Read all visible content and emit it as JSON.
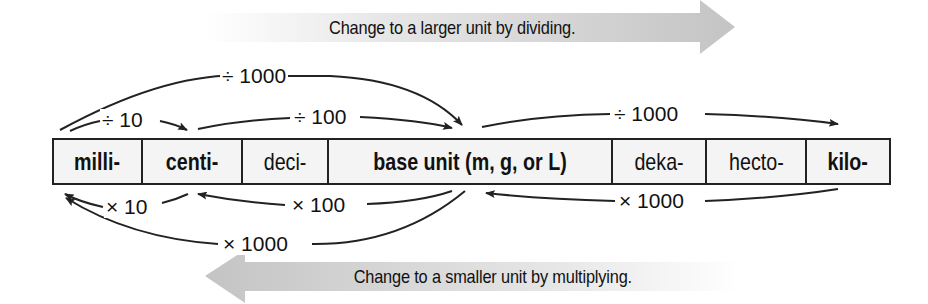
{
  "banners": {
    "top": "Change to a larger unit by dividing.",
    "bottom": "Change to a smaller unit by multiplying."
  },
  "units": [
    {
      "label": "milli-",
      "bold": true
    },
    {
      "label": "centi-",
      "bold": true
    },
    {
      "label": "deci-",
      "bold": false
    },
    {
      "label": "base unit (m, g, or L)",
      "bold": true
    },
    {
      "label": "deka-",
      "bold": false
    },
    {
      "label": "hecto-",
      "bold": false
    },
    {
      "label": "kilo-",
      "bold": true
    }
  ],
  "conversions": {
    "divide": [
      {
        "from": "milli-",
        "to": "centi-",
        "label": "÷ 10"
      },
      {
        "from": "centi-",
        "to": "base unit",
        "label": "÷ 100"
      },
      {
        "from": "milli-",
        "to": "base unit",
        "label": "÷ 1000"
      },
      {
        "from": "base unit",
        "to": "kilo-",
        "label": "÷ 1000"
      }
    ],
    "multiply": [
      {
        "from": "centi-",
        "to": "milli-",
        "label": "× 10"
      },
      {
        "from": "base unit",
        "to": "centi-",
        "label": "× 100"
      },
      {
        "from": "base unit",
        "to": "milli-",
        "label": "× 1000"
      },
      {
        "from": "kilo-",
        "to": "base unit",
        "label": "× 1000"
      }
    ]
  },
  "colors": {
    "banner_gray": "#c8c8c8",
    "cell_fill": "#f4f4f4",
    "line": "#222222"
  }
}
